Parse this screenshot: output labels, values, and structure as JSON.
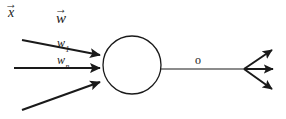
{
  "figure": {
    "background_color": "#ffffff",
    "ink_color": "#1a1a1a",
    "width": 286,
    "height": 119
  },
  "labels": {
    "input_vector": {
      "symbol": "x",
      "accent": "→"
    },
    "weight_vector": {
      "symbol": "w",
      "accent": "→"
    },
    "weight_first": {
      "symbol": "w",
      "subscript": "1"
    },
    "weight_last": {
      "symbol": "w",
      "subscript": "n"
    },
    "output": {
      "symbol": "o"
    }
  },
  "geometry": {
    "soma": {
      "cx": 132,
      "cy": 65,
      "r": 29,
      "stroke_width": 1.3
    },
    "input_edges": [
      {
        "name": "input-edge-top",
        "x1": 22,
        "y1": 40,
        "x2": 101,
        "y2": 55
      },
      {
        "name": "input-edge-middle",
        "x1": 14,
        "y1": 68,
        "x2": 101,
        "y2": 68
      },
      {
        "name": "input-edge-bottom",
        "x1": 22,
        "y1": 110,
        "x2": 101,
        "y2": 82
      }
    ],
    "axon": {
      "x1": 161,
      "y1": 69,
      "x2": 246,
      "y2": 69
    },
    "output_edges": [
      {
        "name": "output-edge-up",
        "x1": 244,
        "y1": 69,
        "x2": 274,
        "y2": 49
      },
      {
        "name": "output-edge-straight",
        "x1": 244,
        "y1": 69,
        "x2": 276,
        "y2": 69
      },
      {
        "name": "output-edge-down",
        "x1": 244,
        "y1": 69,
        "x2": 274,
        "y2": 90
      }
    ]
  }
}
